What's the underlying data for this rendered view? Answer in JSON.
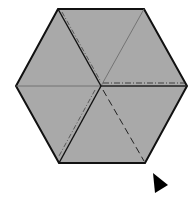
{
  "diagram": {
    "type": "origami-fold-step",
    "shape": "hexagon",
    "colors": {
      "fill": "#a9a9a9",
      "outline": "#111111",
      "fold_line": "#555555",
      "background": "#ffffff",
      "arrow": "#000000"
    },
    "hexagon_vertices": [
      [
        58,
        9
      ],
      [
        144,
        9
      ],
      [
        187,
        86
      ],
      [
        145,
        163
      ],
      [
        59,
        163
      ],
      [
        16,
        86
      ]
    ],
    "center": [
      101,
      86
    ],
    "lines": [
      {
        "name": "mountain-fold-upper-left",
        "from": [
          58,
          9
        ],
        "to": [
          101,
          86
        ],
        "style": "dash-dot"
      },
      {
        "name": "valley-fold-upper-right",
        "from": [
          144,
          9
        ],
        "to": [
          101,
          86
        ],
        "style": "thin"
      },
      {
        "name": "mountain-fold-right",
        "from": [
          101,
          86
        ],
        "to": [
          187,
          86
        ],
        "style": "dash-dot"
      },
      {
        "name": "valley-fold-lower-right",
        "from": [
          101,
          86
        ],
        "to": [
          145,
          163
        ],
        "style": "dashed"
      },
      {
        "name": "mountain-fold-lower-left",
        "from": [
          101,
          86
        ],
        "to": [
          59,
          163
        ],
        "style": "dash-dot"
      },
      {
        "name": "crease-left",
        "from": [
          16,
          86
        ],
        "to": [
          101,
          86
        ],
        "style": "thin"
      }
    ],
    "arrow": {
      "direction": "right",
      "points": [
        [
          153,
          173
        ],
        [
          168,
          185
        ],
        [
          155,
          193
        ]
      ]
    }
  }
}
